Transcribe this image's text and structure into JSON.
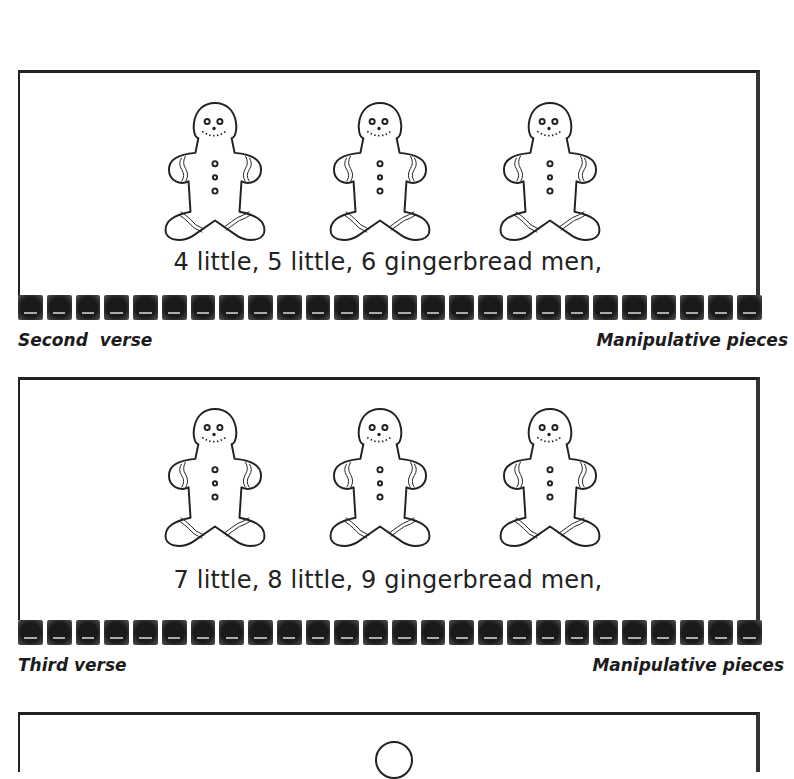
{
  "panels": [
    {
      "caption": "4 little, 5 little, 6 gingerbread men,",
      "figures": [
        "gingerbread-man",
        "gingerbread-man",
        "gingerbread-man"
      ]
    },
    {
      "caption": "7 little, 8 little, 9 gingerbread men,",
      "figures": [
        "gingerbread-man",
        "gingerbread-man",
        "gingerbread-man"
      ]
    },
    {
      "caption": "",
      "figures": []
    }
  ],
  "labels": [
    {
      "left": "Second  verse",
      "right": "Manipulative pieces"
    },
    {
      "left": "Third verse",
      "right": "Manipulative pieces"
    }
  ],
  "strip": {
    "tile_count": 26,
    "tile_color": "#1a1a1a"
  }
}
